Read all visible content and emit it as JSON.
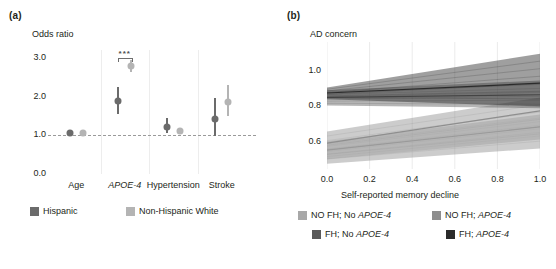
{
  "figure": {
    "panels": [
      {
        "tag": "(a)"
      },
      {
        "tag": "(b)"
      }
    ]
  },
  "panel_a": {
    "tag": "(a)",
    "axis_title": "Odds ratio",
    "significance": "***",
    "legend": [
      {
        "label": "Hispanic",
        "color": "#6b6b6b"
      },
      {
        "label": "Non-Hispanic White",
        "color": "#b4b4b4"
      }
    ],
    "chart_data": {
      "type": "scatter",
      "title": "Odds ratio",
      "xlabel": "",
      "ylabel": "Odds ratio",
      "ylim": [
        0.0,
        3.2
      ],
      "yticks": [
        "0.0",
        "1.0",
        "2.0",
        "3.0"
      ],
      "ytick_values": [
        0.0,
        1.0,
        2.0,
        3.0
      ],
      "reference_line": 1.0,
      "grid": "vertical-separators",
      "legend_position": "bottom",
      "categories": [
        "Age",
        "APOE-4",
        "Hypertension",
        "Stroke"
      ],
      "categories_italic": [
        false,
        true,
        false,
        false
      ],
      "annotations": [
        {
          "text": "***",
          "category": "APOE-4",
          "y": 3.05
        }
      ],
      "series": [
        {
          "name": "Hispanic",
          "color": "#6b6b6b",
          "values": [
            1.05,
            1.88,
            1.22,
            1.43
          ],
          "ci_low": [
            1.02,
            1.55,
            1.05,
            0.98
          ],
          "ci_high": [
            1.08,
            2.25,
            1.45,
            1.95
          ]
        },
        {
          "name": "Non-Hispanic White",
          "color": "#b4b4b4",
          "values": [
            1.05,
            2.78,
            1.1,
            1.87
          ],
          "ci_low": [
            1.03,
            2.62,
            1.02,
            1.5
          ],
          "ci_high": [
            1.07,
            2.95,
            1.2,
            2.3
          ]
        }
      ]
    }
  },
  "panel_b": {
    "tag": "(b)",
    "axis_title": "AD concern",
    "xlabel": "Self-reported memory decline",
    "legend": [
      {
        "label_pre": "NO FH; No ",
        "label_em": "APOE-4",
        "color": "#a8a8a8"
      },
      {
        "label_pre": "NO FH; ",
        "label_em": "APOE-4",
        "color": "#8e8e8e"
      },
      {
        "label_pre": "FH; No ",
        "label_em": "APOE-4",
        "color": "#5a5a5a"
      },
      {
        "label_pre": "FH; ",
        "label_em": "APOE-4",
        "color": "#2b2b2b"
      }
    ],
    "chart_data": {
      "type": "area",
      "title": "AD concern",
      "xlabel": "Self-reported memory decline",
      "ylabel": "AD concern",
      "xlim": [
        0.0,
        1.0
      ],
      "ylim": [
        0.45,
        1.16
      ],
      "xticks": [
        "0.0",
        "0.2",
        "0.4",
        "0.6",
        "0.8",
        "1.0"
      ],
      "xtick_values": [
        0.0,
        0.2,
        0.4,
        0.6,
        0.8,
        1.0
      ],
      "yticks": [
        "0.6",
        "0.8",
        "1.0"
      ],
      "ytick_values": [
        0.6,
        0.8,
        1.0
      ],
      "grid": "vertical",
      "legend_position": "bottom",
      "x": [
        0.0,
        1.0
      ],
      "series": [
        {
          "name": "NO FH; No APOE-4",
          "color": "#a8a8a8",
          "values": [
            0.555,
            0.685
          ],
          "ci_low": [
            0.505,
            0.615
          ],
          "ci_high": [
            0.605,
            0.755
          ]
        },
        {
          "name": "NO FH; APOE-4",
          "color": "#8e8e8e",
          "values": [
            0.595,
            0.775
          ],
          "ci_low": [
            0.48,
            0.565
          ],
          "ci_high": [
            0.66,
            0.85
          ]
        },
        {
          "name": "FH; No APOE-4",
          "color": "#5a5a5a",
          "values": [
            0.85,
            0.865
          ],
          "ci_low": [
            0.805,
            0.79
          ],
          "ci_high": [
            0.89,
            0.945
          ]
        },
        {
          "name": "FH; APOE-4",
          "color": "#2b2b2b",
          "values": [
            0.875,
            0.93
          ],
          "ci_low": [
            0.84,
            0.8
          ],
          "ci_high": [
            0.905,
            1.095
          ]
        }
      ]
    }
  }
}
